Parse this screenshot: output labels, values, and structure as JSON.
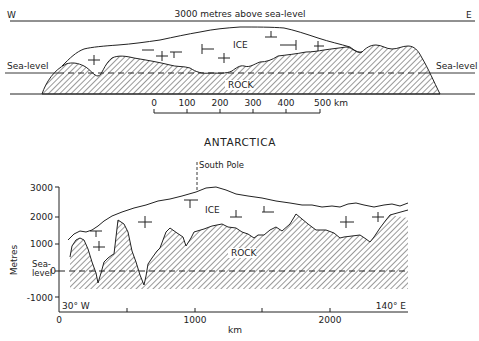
{
  "top_section": {
    "west_label": "W",
    "east_label": "E",
    "top_line_label": "3000 metres above sea-level",
    "sea_level_left": "Sea-level",
    "sea_level_right": "Sea-level",
    "ice_label": "ICE",
    "rock_label": "ROCK",
    "scale_bar": {
      "ticks": [
        "0",
        "100",
        "200",
        "300",
        "400",
        "500 km"
      ]
    }
  },
  "title": "ANTARCTICA",
  "bottom_section": {
    "south_pole_label": "South Pole",
    "ice_label": "ICE",
    "rock_label": "ROCK",
    "y_axis": {
      "label": "Metres",
      "ticks": [
        "3000",
        "2000",
        "1000",
        "0",
        "-1000"
      ],
      "sea_level_label_line1": "Sea-",
      "sea_level_label_line2": "level"
    },
    "x_axis": {
      "label": "km",
      "ticks": [
        "0",
        "1000",
        "2000"
      ],
      "left_corner": "30° W",
      "right_corner": "140° E"
    }
  },
  "colors": {
    "ink": "#1a1a1a",
    "background": "#ffffff"
  }
}
